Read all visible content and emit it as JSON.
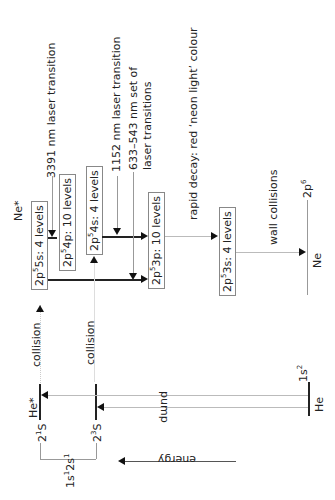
{
  "diagram": {
    "orientation": "rotated 90 degrees counter-clockwise",
    "energy_axis_label": "energy",
    "helium": {
      "label_excited": "He*",
      "label_ground": "He",
      "ground_state": "1s",
      "ground_state_sup": "2",
      "level_singlet": "2",
      "level_singlet_sup": "1",
      "level_singlet_S": "S",
      "level_triplet": "2",
      "level_triplet_sup": "3",
      "level_triplet_S": "S",
      "config": "1s",
      "config_sup1": "1",
      "config_mid": "2s",
      "config_sup2": "1",
      "pump_label": "pump",
      "collision_label_1": "collision",
      "collision_label_2": "collision"
    },
    "neon": {
      "label_excited": "Ne*",
      "label_ground": "Ne",
      "ground_state_base": "2p",
      "ground_state_sup": "6",
      "levels": [
        {
          "pre": "2p",
          "sup": "5",
          "post": "5s: 4 levels"
        },
        {
          "pre": "2p",
          "sup": "5",
          "post": "4p: 10 levels"
        },
        {
          "pre": "2p",
          "sup": "5",
          "post": "4s: 4 levels"
        },
        {
          "pre": "2p",
          "sup": "5",
          "post": "3p: 10 levels"
        },
        {
          "pre": "2p",
          "sup": "5",
          "post": "3s: 4 levels"
        }
      ],
      "transitions": {
        "t3391": "3391 nm laser transition",
        "t1152": "1152 nm laser transition",
        "t633_line1": "633–543 nm set of",
        "t633_line2": "laser transitions",
        "rapid_decay": "rapid decay: red ‘neon light’ colour",
        "wall": "wall collisions"
      }
    }
  }
}
